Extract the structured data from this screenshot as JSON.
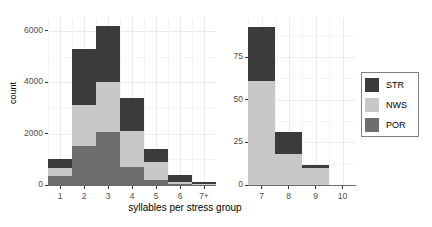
{
  "chart_data": {
    "type": "bar",
    "title": "",
    "subtitle": "",
    "xlabel": "syllables per stress group",
    "ylabel": "count",
    "stacked": true,
    "legend_position": "right",
    "grid": true,
    "legend": [
      {
        "name": "STR",
        "color": "#3b3b3b"
      },
      {
        "name": "NWS",
        "color": "#c8c8c8"
      },
      {
        "name": "POR",
        "color": "#6e6e6e"
      }
    ],
    "panels": [
      {
        "name": "left-panel",
        "categories": [
          "1",
          "2",
          "3",
          "4",
          "5",
          "6",
          "7+"
        ],
        "ylim": [
          0,
          6500
        ],
        "yticks": [
          0,
          2000,
          4000,
          6000
        ],
        "yticklabels": [
          "0",
          "2000",
          "4000",
          "6000"
        ],
        "yminorticks": [
          1000,
          3000,
          5000
        ],
        "series": [
          {
            "name": "POR",
            "color": "#6e6e6e",
            "values": [
              350,
              1500,
              2050,
              700,
              200,
              30,
              10
            ]
          },
          {
            "name": "NWS",
            "color": "#c8c8c8",
            "values": [
              300,
              1600,
              1950,
              1400,
              700,
              100,
              30
            ]
          },
          {
            "name": "STR",
            "color": "#3b3b3b",
            "values": [
              350,
              2200,
              2200,
              1300,
              500,
              270,
              60
            ]
          }
        ],
        "totals": [
          1000,
          5300,
          6200,
          3400,
          1400,
          400,
          100
        ]
      },
      {
        "name": "right-panel",
        "categories": [
          "7",
          "8",
          "9",
          "10"
        ],
        "ylim": [
          0,
          98
        ],
        "yticks": [
          0,
          25,
          50,
          75
        ],
        "yticklabels": [
          "0",
          "25",
          "50",
          "75"
        ],
        "yminorticks": [
          12.5,
          37.5,
          62.5,
          87.5
        ],
        "series": [
          {
            "name": "POR",
            "color": "#6e6e6e",
            "values": [
              0,
              0,
              0,
              0
            ]
          },
          {
            "name": "NWS",
            "color": "#c8c8c8",
            "values": [
              61,
              18,
              10,
              0
            ]
          },
          {
            "name": "STR",
            "color": "#3b3b3b",
            "values": [
              32,
              13,
              2,
              0
            ]
          }
        ],
        "totals": [
          93,
          31,
          12,
          0
        ]
      }
    ]
  }
}
